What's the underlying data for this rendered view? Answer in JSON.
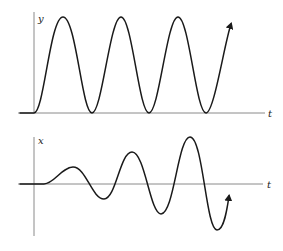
{
  "diagram": {
    "top_plot": {
      "vertical_axis_label": "y",
      "horizontal_axis_label": "t",
      "description": "Constant-amplitude oscillation starting from rest, touching the baseline at troughs"
    },
    "bottom_plot": {
      "vertical_axis_label": "x",
      "horizontal_axis_label": "t",
      "description": "Oscillation with growing amplitude about the t-axis (resonance-like)"
    }
  }
}
